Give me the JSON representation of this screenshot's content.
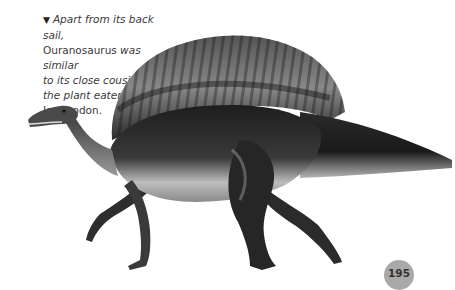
{
  "caption": {
    "arrow": "▼",
    "part1": "Apart from its back sail,",
    "name1": "Ouranosaurus",
    "part2": " was similar",
    "part3": "to its close cousin,",
    "part4": "the plant eater",
    "name2": "Iguanodon."
  },
  "illustration": {
    "subject": "Ouranosaurus",
    "style": "greyscale painted illustration"
  },
  "page": {
    "number": "195",
    "badge_color": "#a9a9a9"
  }
}
